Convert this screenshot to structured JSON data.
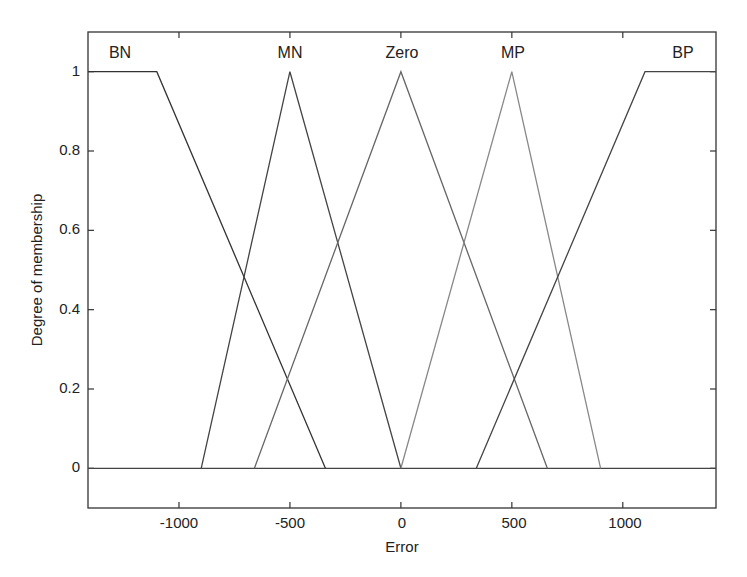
{
  "chart_data": {
    "type": "line",
    "title": "",
    "xlabel": "Error",
    "ylabel": "Degree of membership",
    "xlim": [
      -1410,
      1420
    ],
    "ylim": [
      -0.1,
      1.1
    ],
    "grid": false,
    "legend": "none (curve labels placed above peaks)",
    "x_ticks": [
      -1000,
      -500,
      0,
      500,
      1000
    ],
    "x_tick_labels": [
      "-1000",
      "-500",
      "0",
      "500",
      "1000"
    ],
    "y_ticks": [
      0,
      0.2,
      0.4,
      0.6,
      0.8,
      1
    ],
    "y_tick_labels": [
      "0",
      "0.2",
      "0.4",
      "0.6",
      "0.8",
      "1"
    ],
    "series": [
      {
        "name": "BN",
        "shape": "trapezoid",
        "x": [
          -1410,
          -1100,
          -340
        ],
        "y": [
          1,
          1,
          0
        ],
        "label_x": -1270
      },
      {
        "name": "MN",
        "shape": "triangle",
        "x": [
          -900,
          -500,
          0
        ],
        "y": [
          0,
          1,
          0
        ],
        "label_x": -500
      },
      {
        "name": "Zero",
        "shape": "triangle",
        "x": [
          -660,
          0,
          660
        ],
        "y": [
          0,
          1,
          0
        ],
        "label_x": 0
      },
      {
        "name": "MP",
        "shape": "triangle",
        "x": [
          0,
          500,
          900
        ],
        "y": [
          0,
          1,
          0
        ],
        "label_x": 500
      },
      {
        "name": "BP",
        "shape": "trapezoid",
        "x": [
          340,
          1100,
          1420
        ],
        "y": [
          0,
          1,
          1
        ],
        "label_x": 1290
      }
    ],
    "baseline_y": 0
  },
  "labels": {
    "xlabel": "Error",
    "ylabel": "Degree of membership",
    "mf": [
      "BN",
      "MN",
      "Zero",
      "MP",
      "BP"
    ],
    "xticks": [
      "-1000",
      "-500",
      "0",
      "500",
      "1000"
    ],
    "yticks": [
      "0",
      "0.2",
      "0.4",
      "0.6",
      "0.8",
      "1"
    ]
  }
}
